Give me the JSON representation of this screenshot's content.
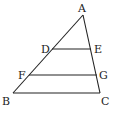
{
  "diagram": {
    "type": "triangle-with-parallel-segments",
    "points": {
      "A": {
        "label": "A",
        "x": 83,
        "y": 15
      },
      "B": {
        "label": "B",
        "x": 13,
        "y": 93
      },
      "C": {
        "label": "C",
        "x": 100,
        "y": 93
      },
      "D": {
        "label": "D",
        "x": 52,
        "y": 49
      },
      "E": {
        "label": "E",
        "x": 91,
        "y": 49
      },
      "F": {
        "label": "F",
        "x": 29,
        "y": 75
      },
      "G": {
        "label": "G",
        "x": 97,
        "y": 75
      }
    },
    "segments": [
      "AB",
      "AC",
      "BC",
      "DE",
      "FG"
    ],
    "stroke_color": "#222222"
  }
}
